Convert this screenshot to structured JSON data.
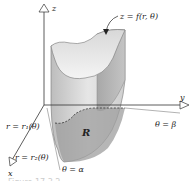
{
  "figure": {
    "axes": {
      "z": "z",
      "y": "y",
      "x": "x"
    },
    "surface_label": "z = f(r, θ)",
    "region_label": "R",
    "boundaries": {
      "inner": "r = r₁(θ)",
      "outer": "r = r₂(θ)",
      "angle_start": "θ = α",
      "angle_end": "θ = β"
    },
    "caption": "Figure 17.3.2"
  }
}
